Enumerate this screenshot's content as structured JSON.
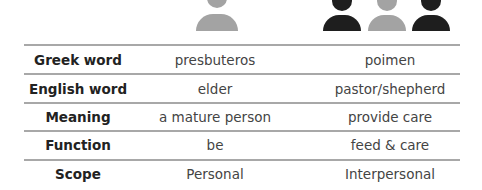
{
  "icons": {
    "presbuteros_icon": {
      "name": "single-person-icon",
      "color": "#a3a3a3"
    },
    "poimen_icons": [
      {
        "name": "person-icon",
        "color": "#1e1e1e"
      },
      {
        "name": "person-icon",
        "color": "#a3a3a3"
      },
      {
        "name": "person-icon",
        "color": "#1e1e1e"
      }
    ]
  },
  "table": {
    "rows": [
      {
        "label": "Greek word",
        "col1": "presbuteros",
        "col2": "poimen"
      },
      {
        "label": "English word",
        "col1": "elder",
        "col2": "pastor/shepherd"
      },
      {
        "label": "Meaning",
        "col1": "a mature person",
        "col2": "provide care"
      },
      {
        "label": "Function",
        "col1": "be",
        "col2": "feed & care"
      },
      {
        "label": "Scope",
        "col1": "Personal",
        "col2": "Interpersonal"
      }
    ]
  }
}
